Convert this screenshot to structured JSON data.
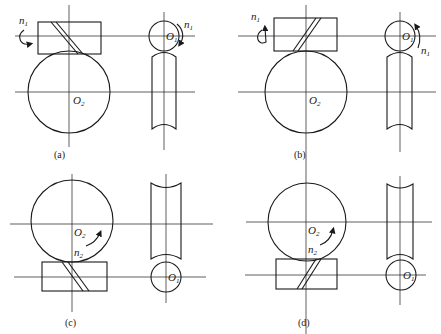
{
  "figure": {
    "panels": [
      {
        "id": "a",
        "caption": "(a)",
        "worm_speed_label": "n",
        "worm_speed_sub": "1",
        "gear_center_label": "O",
        "gear_center_sub": "2",
        "wheel_center_label": "O",
        "wheel_center_sub": "1",
        "wheel_speed_label": "n",
        "wheel_speed_sub": "1"
      },
      {
        "id": "b",
        "caption": "(b)",
        "worm_speed_label": "n",
        "worm_speed_sub": "1",
        "gear_center_label": "O",
        "gear_center_sub": "2",
        "wheel_center_label": "O",
        "wheel_center_sub": "1",
        "wheel_speed_label": "n",
        "wheel_speed_sub": "1"
      },
      {
        "id": "c",
        "caption": "(c)",
        "gear_center_label": "O",
        "gear_center_sub": "2",
        "gear_speed_label": "n",
        "gear_speed_sub": "2",
        "wheel_center_label": "O",
        "wheel_center_sub": "1"
      },
      {
        "id": "d",
        "caption": "(d)",
        "gear_center_label": "O",
        "gear_center_sub": "2",
        "gear_speed_label": "n",
        "gear_speed_sub": "2",
        "wheel_center_label": "O",
        "wheel_center_sub": "1"
      }
    ]
  }
}
